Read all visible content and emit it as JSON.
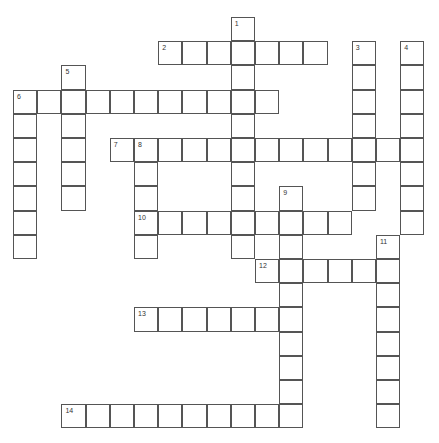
{
  "puzzle": {
    "origin": {
      "x": 13,
      "y": 17
    },
    "cell_size": 24.2,
    "line_color": "#555555",
    "words": [
      {
        "number": "1",
        "direction": "down",
        "col": 9,
        "row": 0,
        "length": 10
      },
      {
        "number": "2",
        "direction": "across",
        "col": 6,
        "row": 1,
        "length": 7
      },
      {
        "number": "3",
        "direction": "down",
        "col": 14,
        "row": 1,
        "length": 7
      },
      {
        "number": "4",
        "direction": "down",
        "col": 16,
        "row": 1,
        "length": 8
      },
      {
        "number": "5",
        "direction": "down",
        "col": 2,
        "row": 2,
        "length": 6
      },
      {
        "number": "6",
        "direction": "across",
        "col": 0,
        "row": 3,
        "length": 11
      },
      {
        "number": "6",
        "direction": "down",
        "col": 0,
        "row": 3,
        "length": 7
      },
      {
        "number": "7",
        "direction": "across",
        "col": 4,
        "row": 5,
        "length": 13
      },
      {
        "number": "8",
        "direction": "down",
        "col": 5,
        "row": 5,
        "length": 5
      },
      {
        "number": "9",
        "direction": "down",
        "col": 11,
        "row": 7,
        "length": 10
      },
      {
        "number": "10",
        "direction": "across",
        "col": 5,
        "row": 8,
        "length": 9
      },
      {
        "number": "11",
        "direction": "down",
        "col": 15,
        "row": 9,
        "length": 8
      },
      {
        "number": "12",
        "direction": "across",
        "col": 10,
        "row": 10,
        "length": 6
      },
      {
        "number": "13",
        "direction": "across",
        "col": 5,
        "row": 12,
        "length": 7
      },
      {
        "number": "14",
        "direction": "across",
        "col": 2,
        "row": 16,
        "length": 10
      }
    ]
  }
}
